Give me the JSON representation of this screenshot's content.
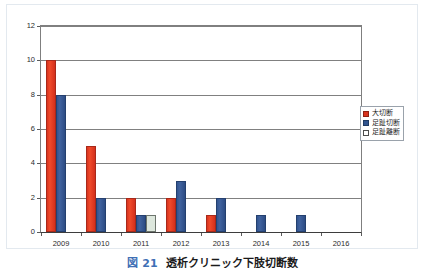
{
  "figure": {
    "caption_number": "図 21",
    "caption_text": "透析クリニック下肢切断数"
  },
  "legend": {
    "position": "right",
    "entries": [
      {
        "label": "大切断",
        "color": "#d8341f"
      },
      {
        "label": "足趾切断",
        "color": "#31548f"
      },
      {
        "label": "足趾離断",
        "color": "#dde7dd"
      }
    ]
  },
  "chart_data": {
    "type": "bar",
    "title": "透析クリニック下肢切断数",
    "xlabel": "",
    "ylabel": "",
    "categories": [
      "2009",
      "2010",
      "2011",
      "2012",
      "2013",
      "2014",
      "2015",
      "2016"
    ],
    "series": [
      {
        "name": "大切断",
        "color": "#d8341f",
        "values": [
          10,
          5,
          2,
          2,
          1,
          0,
          0,
          0
        ]
      },
      {
        "name": "足趾切断",
        "color": "#31548f",
        "values": [
          8,
          2,
          1,
          3,
          2,
          1,
          1,
          0
        ]
      },
      {
        "name": "足趾離断",
        "color": "#dde7dd",
        "values": [
          0,
          0,
          1,
          0,
          0,
          0,
          0,
          0
        ]
      }
    ],
    "ylim": [
      0,
      12
    ],
    "yticks": [
      0,
      2,
      4,
      6,
      8,
      10,
      12
    ],
    "ytick_labels": [
      "0",
      "2",
      "4",
      "6",
      "8",
      "10",
      "12"
    ],
    "grid": true,
    "legend_position": "right"
  }
}
